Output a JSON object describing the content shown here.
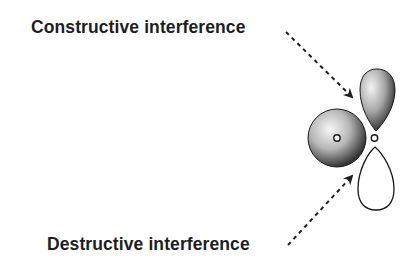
{
  "labels": {
    "constructive": "Constructive interference",
    "destructive": "Destructive interference"
  },
  "diagram": {
    "s_orbital": {
      "phase": "shaded"
    },
    "p_orbital": {
      "upper_lobe_phase": "shaded",
      "lower_lobe_phase": "unshaded"
    },
    "colors": {
      "text": "#1e1e1e",
      "outline": "#111111",
      "shade_dark": "#2a2a2a",
      "shade_light": "#f4f4f4"
    }
  }
}
